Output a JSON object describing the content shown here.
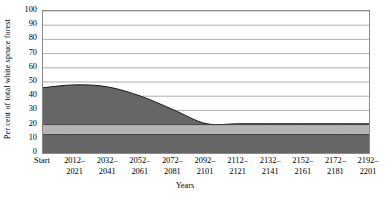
{
  "chart_data": {
    "type": "area",
    "title": "",
    "xlabel": "Years",
    "ylabel": "Per cent of total white spruce forest",
    "ylim": [
      0,
      100
    ],
    "ytick_step": 10,
    "yticks": [
      0,
      10,
      20,
      30,
      40,
      50,
      60,
      70,
      80,
      90,
      100
    ],
    "ytick_labels": [
      "0",
      "10",
      "20",
      "30",
      "40",
      "50",
      "60",
      "70",
      "80",
      "90",
      "100"
    ],
    "grid": "horizontal",
    "stacked": true,
    "categories": [
      "Start",
      "2012-2021",
      "2032-2041",
      "2052-2061",
      "2072-2081",
      "2092-2101",
      "2112-2121",
      "2132-2141",
      "2152-2161",
      "2172-2181",
      "2192-2201"
    ],
    "xtick_labels": [
      {
        "line1": "Start",
        "line2": ""
      },
      {
        "line1": "2012–",
        "line2": "2021"
      },
      {
        "line1": "2032–",
        "line2": "2041"
      },
      {
        "line1": "2052–",
        "line2": "2061"
      },
      {
        "line1": "2072–",
        "line2": "2081"
      },
      {
        "line1": "2092–",
        "line2": "2101"
      },
      {
        "line1": "2112–",
        "line2": "2121"
      },
      {
        "line1": "2132–",
        "line2": "2141"
      },
      {
        "line1": "2152–",
        "line2": "2161"
      },
      {
        "line1": "2172–",
        "line2": "2181"
      },
      {
        "line1": "2192–",
        "line2": "2201"
      }
    ],
    "series": [
      {
        "name": "lower-dark-band",
        "color": "#666666",
        "values": [
          13,
          13,
          13,
          13,
          13,
          13,
          13,
          13,
          13,
          13,
          13
        ]
      },
      {
        "name": "light-band",
        "color": "#b5b5b5",
        "values": [
          7,
          7,
          7,
          7,
          7,
          7,
          7,
          7,
          7,
          7,
          7
        ]
      },
      {
        "name": "upper-dark-band",
        "color": "#666666",
        "values": [
          26,
          28,
          26.5,
          20,
          10.5,
          0.7,
          0.6,
          0.6,
          0.6,
          0.6,
          0.6
        ]
      }
    ],
    "cumulative_top_curve": [
      46,
      48,
      46.5,
      40,
      30.5,
      20.7,
      20.6,
      20.6,
      20.6,
      20.6,
      20.6
    ],
    "colors": {
      "dark": "#666666",
      "light": "#b5b5b5",
      "frame": "#8a8a8a",
      "gridline": "#9a9a9a",
      "outline": "#1a1a1a",
      "background": "#ffffff"
    }
  }
}
